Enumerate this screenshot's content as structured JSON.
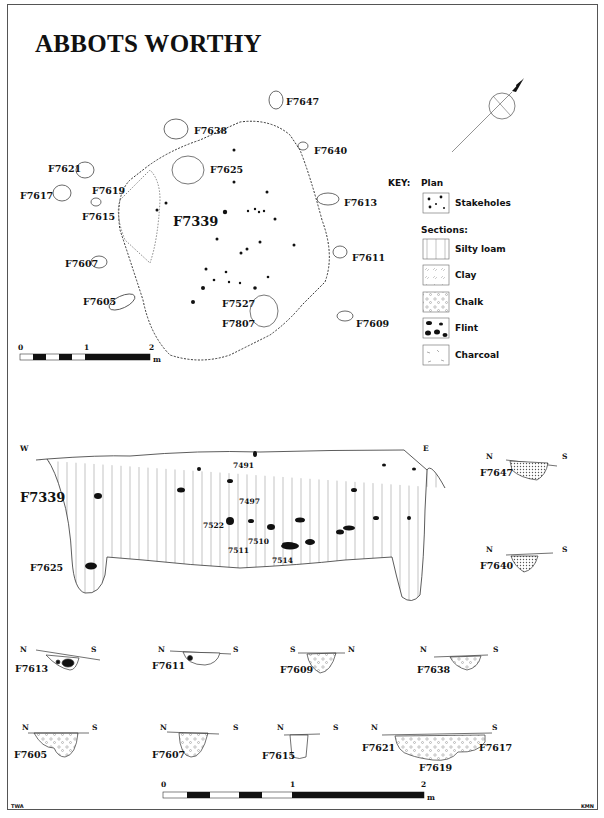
{
  "title": "ABBOTS WORTHY",
  "plan": {
    "main_feature": "F7339",
    "features": [
      {
        "id": "F7647",
        "x": 276,
        "y": 100
      },
      {
        "id": "F7638",
        "x": 175,
        "y": 130
      },
      {
        "id": "F7640",
        "x": 305,
        "y": 148
      },
      {
        "id": "F7625",
        "x": 190,
        "y": 170
      },
      {
        "id": "F7621",
        "x": 75,
        "y": 168
      },
      {
        "id": "F7619",
        "x": 96,
        "y": 189
      },
      {
        "id": "F7617",
        "x": 42,
        "y": 194
      },
      {
        "id": "F7615",
        "x": 90,
        "y": 214
      },
      {
        "id": "F7613",
        "x": 340,
        "y": 199
      },
      {
        "id": "F7611",
        "x": 349,
        "y": 256
      },
      {
        "id": "F7607",
        "x": 86,
        "y": 262
      },
      {
        "id": "F7605",
        "x": 106,
        "y": 302
      },
      {
        "id": "F7527",
        "x": 248,
        "y": 303
      },
      {
        "id": "F7807",
        "x": 248,
        "y": 322
      },
      {
        "id": "F7609",
        "x": 359,
        "y": 322
      }
    ],
    "scale": {
      "ticks": [
        "0",
        "1",
        "2"
      ],
      "unit": "m"
    }
  },
  "key": {
    "heading": "KEY:",
    "plan_heading": "Plan",
    "plan_items": [
      {
        "label": "Stakeholes",
        "pattern": "stakeholes"
      }
    ],
    "sections_heading": "Sections:",
    "section_items": [
      {
        "label": "Silty loam",
        "pattern": "silty-loam"
      },
      {
        "label": "Clay",
        "pattern": "clay"
      },
      {
        "label": "Chalk",
        "pattern": "chalk"
      },
      {
        "label": "Flint",
        "pattern": "flint"
      },
      {
        "label": "Charcoal",
        "pattern": "charcoal"
      }
    ]
  },
  "main_section": {
    "feature": "F7339",
    "sub_feature": "F7625",
    "west": "W",
    "east": "E",
    "contexts": [
      "7491",
      "7497",
      "7522",
      "7510",
      "7511",
      "7514"
    ]
  },
  "small_sections": [
    {
      "id": "F7647",
      "left": "N",
      "right": "S"
    },
    {
      "id": "F7640",
      "left": "N",
      "right": "S"
    },
    {
      "id": "F7613",
      "left": "N",
      "right": "S"
    },
    {
      "id": "F7611",
      "left": "N",
      "right": "S"
    },
    {
      "id": "F7609",
      "left": "S",
      "right": "N"
    },
    {
      "id": "F7638",
      "left": "N",
      "right": "S"
    },
    {
      "id": "F7605",
      "left": "N",
      "right": "S"
    },
    {
      "id": "F7607",
      "left": "N",
      "right": "S"
    },
    {
      "id": "F7615",
      "left": "N",
      "right": "S"
    },
    {
      "id": "F7621",
      "left": "N",
      "right": "S",
      "group": [
        "F7621",
        "F7619",
        "F7617"
      ]
    }
  ],
  "section_scale": {
    "ticks": [
      "0",
      "1",
      "2"
    ],
    "unit": "m"
  },
  "credits": {
    "left": "TWA",
    "right": "KMN"
  }
}
